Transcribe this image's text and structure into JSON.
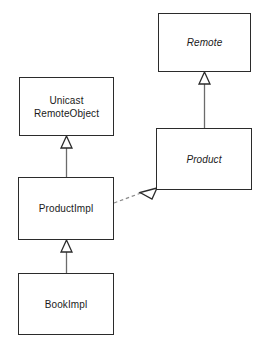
{
  "diagram": {
    "kind": "uml-class-diagram",
    "canvas": {
      "width": 266,
      "height": 352
    },
    "background_color": "#ffffff",
    "line_color": "#2b2b2b",
    "text_color": "#1a1a1a",
    "classes": [
      {
        "id": "remote",
        "name": "Remote",
        "stereotype": "interface",
        "abstract": true,
        "x": 158,
        "y": 13,
        "width": 93,
        "height": 59
      },
      {
        "id": "unicast-remote-object",
        "name": "Unicast\nRemoteObject",
        "stereotype": "class",
        "abstract": false,
        "x": 19,
        "y": 77,
        "width": 95,
        "height": 59
      },
      {
        "id": "product",
        "name": "Product",
        "stereotype": "interface",
        "abstract": true,
        "x": 156,
        "y": 128,
        "width": 96,
        "height": 62
      },
      {
        "id": "product-impl",
        "name": "ProductImpl",
        "stereotype": "class",
        "abstract": false,
        "x": 18,
        "y": 177,
        "width": 96,
        "height": 63
      },
      {
        "id": "book-impl",
        "name": "BookImpl",
        "stereotype": "class",
        "abstract": false,
        "x": 18,
        "y": 273,
        "width": 96,
        "height": 62
      }
    ],
    "relationships": [
      {
        "id": "product-extends-remote",
        "type": "generalization",
        "style": "solid",
        "arrowhead": "hollow-triangle",
        "from": "product",
        "to": "remote",
        "label": ""
      },
      {
        "id": "productimpl-extends-unicastremoteobject",
        "type": "generalization",
        "style": "solid",
        "arrowhead": "hollow-triangle",
        "from": "product-impl",
        "to": "unicast-remote-object",
        "label": ""
      },
      {
        "id": "bookimpl-extends-productimpl",
        "type": "generalization",
        "style": "solid",
        "arrowhead": "hollow-triangle",
        "from": "book-impl",
        "to": "product-impl",
        "label": ""
      },
      {
        "id": "productimpl-implements-product",
        "type": "realization",
        "style": "dashed",
        "arrowhead": "hollow-triangle",
        "from": "product-impl",
        "to": "product",
        "label": ""
      }
    ]
  }
}
